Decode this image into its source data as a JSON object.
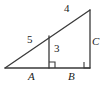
{
  "figure": {
    "background_color": "#ffffff",
    "stroke_color": "#3a3a3a",
    "label_color": "#1a1a1a",
    "width": 107,
    "height": 88,
    "labels": {
      "hypotenuse_lower": "5",
      "hypotenuse_upper": "4",
      "altitude": "3",
      "base_left": "A",
      "base_right": "B",
      "vertical_leg": "C"
    },
    "right_angle_marks": [
      {
        "name": "right-angle-at-altitude-foot",
        "x": 49,
        "y": 68
      },
      {
        "name": "right-angle-at-base-right",
        "x": 90,
        "y": 68
      }
    ],
    "points": {
      "left_apex": {
        "x": 5,
        "y": 68
      },
      "top_right": {
        "x": 90,
        "y": 10
      },
      "bottom_right": {
        "x": 90,
        "y": 68
      },
      "altitude_foot": {
        "x": 49,
        "y": 68
      },
      "altitude_top": {
        "x": 49,
        "y": 36
      }
    },
    "segments": [
      {
        "name": "hypotenuse",
        "from": "left_apex",
        "to": "top_right"
      },
      {
        "name": "base",
        "from": "left_apex",
        "to": "bottom_right"
      },
      {
        "name": "vertical-leg",
        "from": "top_right",
        "to": "bottom_right"
      },
      {
        "name": "altitude",
        "from": "altitude_top",
        "to": "altitude_foot"
      }
    ]
  },
  "label_positions": {
    "hypotenuse_lower": {
      "x": 27,
      "y": 34
    },
    "hypotenuse_upper": {
      "x": 64,
      "y": 3
    },
    "altitude": {
      "x": 54,
      "y": 43
    },
    "base_left": {
      "x": 28,
      "y": 71
    },
    "base_right": {
      "x": 68,
      "y": 71
    },
    "vertical_leg": {
      "x": 92,
      "y": 36
    }
  }
}
